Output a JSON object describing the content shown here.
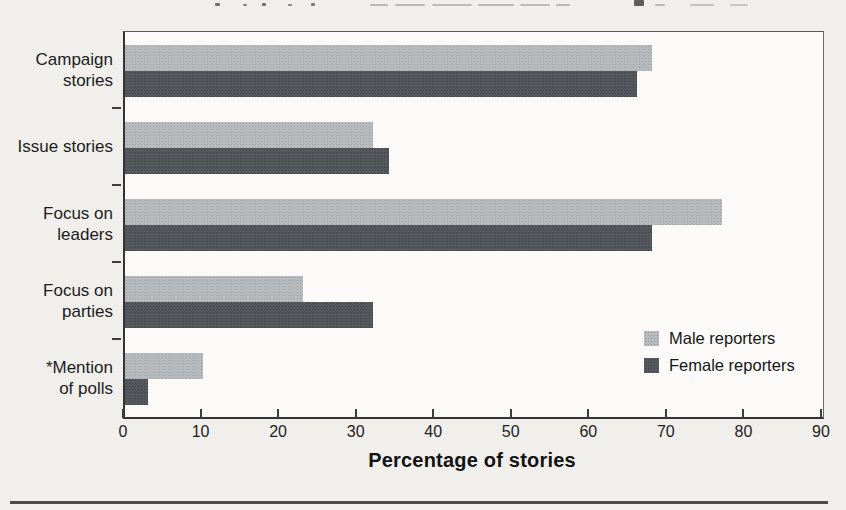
{
  "figure": {
    "xlabel": "Percentage of stories"
  },
  "chart_data": {
    "type": "bar",
    "orientation": "horizontal",
    "categories": [
      "Campaign stories",
      "Issue stories",
      "Focus on leaders",
      "Focus on parties",
      "*Mention of polls"
    ],
    "categories_display": [
      [
        "Campaign",
        "stories"
      ],
      [
        "Issue stories"
      ],
      [
        "Focus on",
        "leaders"
      ],
      [
        "Focus on",
        "parties"
      ],
      [
        "*Mention",
        "of polls"
      ]
    ],
    "series": [
      {
        "name": "Male reporters",
        "color": "#b7babc",
        "values": [
          68,
          32,
          77,
          23,
          10
        ]
      },
      {
        "name": "Female reporters",
        "color": "#54585c",
        "values": [
          66,
          34,
          68,
          32,
          3
        ]
      }
    ],
    "xlabel": "Percentage of stories",
    "xlim": [
      0,
      90
    ],
    "xticks": [
      0,
      10,
      20,
      30,
      40,
      50,
      60,
      70,
      80,
      90
    ],
    "grid": false,
    "legend_position": "inside-lower-right"
  }
}
